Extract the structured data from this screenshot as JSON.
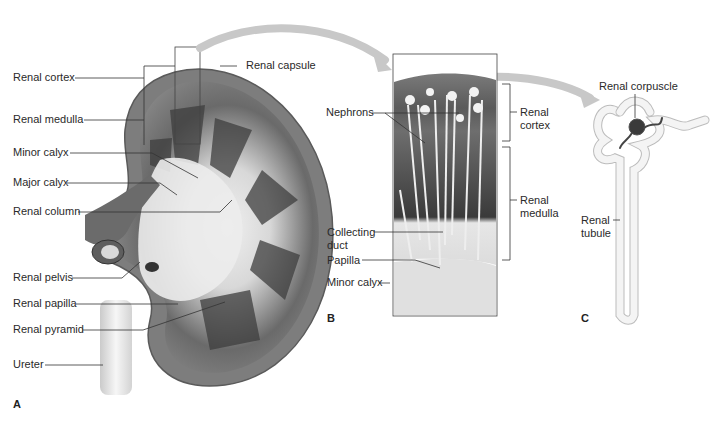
{
  "figure": {
    "colors": {
      "capsule": "#7a7a7a",
      "cortex": "#8e8e8e",
      "medulla_dark": "#3c3c3c",
      "sinus": "#e8e8e8",
      "arrow": "#c4c4c4",
      "leader": "#333333"
    }
  },
  "panels": {
    "a": {
      "letter": "A",
      "labels": {
        "renal_cortex": "Renal cortex",
        "renal_medulla": "Renal medulla",
        "minor_calyx": "Minor calyx",
        "major_calyx": "Major calyx",
        "renal_column": "Renal column",
        "renal_pelvis": "Renal pelvis",
        "renal_papilla": "Renal papilla",
        "renal_pyramid": "Renal pyramid",
        "ureter": "Ureter",
        "renal_capsule": "Renal capsule"
      }
    },
    "b": {
      "letter": "B",
      "labels": {
        "nephrons": "Nephrons",
        "collecting_duct_1": "Collecting",
        "collecting_duct_2": "duct",
        "papilla": "Papilla",
        "minor_calyx": "Minor calyx",
        "renal_cortex_1": "Renal",
        "renal_cortex_2": "cortex",
        "renal_medulla_1": "Renal",
        "renal_medulla_2": "medulla"
      }
    },
    "c": {
      "letter": "C",
      "labels": {
        "renal_corpuscle": "Renal corpuscle",
        "renal_tubule_1": "Renal",
        "renal_tubule_2": "tubule"
      }
    }
  }
}
